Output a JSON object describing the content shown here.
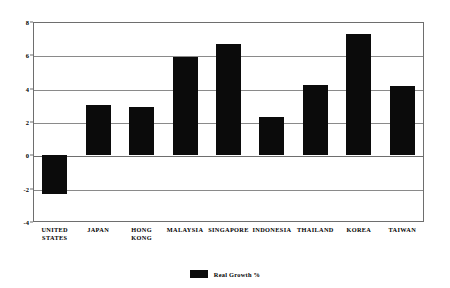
{
  "chart_data": {
    "type": "bar",
    "title": "",
    "xlabel": "",
    "ylabel": "",
    "ylim": [
      -4,
      8
    ],
    "yticks": [
      8,
      6,
      4,
      2,
      0,
      -2,
      -4
    ],
    "ytick_labels": [
      "8",
      "6",
      "4",
      "2",
      "0",
      "-2",
      "-4"
    ],
    "grid": true,
    "legend_position": "bottom-center",
    "categories": [
      "UNITED\nSTATES",
      "JAPAN",
      "HONG\nKONG",
      "MALAYSIA",
      "SINGAPORE",
      "INDONESIA",
      "THAILAND",
      "KOREA",
      "TAIWAN"
    ],
    "series": [
      {
        "name": "Real Growth %",
        "color": "#0b0b0b",
        "values": [
          -2.3,
          3.0,
          2.9,
          5.9,
          6.7,
          2.3,
          4.2,
          7.3,
          4.15
        ]
      }
    ]
  },
  "legend": {
    "label": "Real Growth %",
    "swatch_color": "#0b0b0b"
  },
  "axis": {
    "frame_color": "#6e6e6e",
    "grid_color": "#8a8a8a"
  }
}
